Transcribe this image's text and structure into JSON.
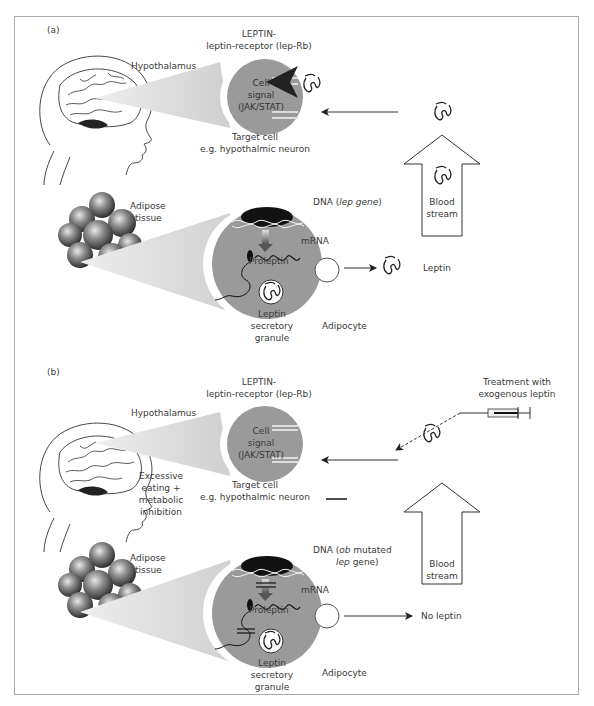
{
  "figure": {
    "panel_a": {
      "label": "(a)",
      "hypothalamus": "Hypothalamus",
      "receptor_line1": "LEPTIN-",
      "receptor_line2": "leptin-receptor (lep-Rb)",
      "cell_line1": "Cell",
      "cell_line2": "signal",
      "cell_line3": "(JAK/STAT)",
      "target_line1": "Target cell",
      "target_line2": "e.g. hypothalmic neuron",
      "adipose_line1": "Adipose",
      "adipose_line2": "tissue",
      "dna_prefix": "DNA (",
      "dna_gene": "lep gene",
      "dna_suffix": ")",
      "mrna": "mRNA",
      "proleptin": "Proleptin",
      "granule_line1": "Leptin",
      "granule_line2": "secretory",
      "granule_line3": "granule",
      "adipocyte": "Adipocyte",
      "leptin": "Leptin",
      "blood_line1": "Blood",
      "blood_line2": "stream"
    },
    "panel_b": {
      "label": "(b)",
      "hypothalamus": "Hypothalamus",
      "receptor_line1": "LEPTIN-",
      "receptor_line2": "leptin-receptor (lep-Rb)",
      "cell_line1": "Cell",
      "cell_line2": "signal",
      "cell_line3": "(JAK/STAT)",
      "target_line1": "Target cell",
      "target_line2": "e.g. hypothalmic neuron",
      "excess_line1": "Excessive",
      "excess_line2": "eating +",
      "excess_line3": "metabolic",
      "excess_line4": "inhibition",
      "treatment_line1": "Treatment with",
      "treatment_line2": "exogenous leptin",
      "adipose_line1": "Adipose",
      "adipose_line2": "tissue",
      "dna_prefix": "DNA (",
      "dna_ob": "ob",
      "dna_mid": " mutated",
      "dna_gene": "lep",
      "dna_suffix": " gene)",
      "mrna": "mRNA",
      "proleptin": "Proleptin",
      "granule_line1": "Leptin",
      "granule_line2": "secretory",
      "granule_line3": "granule",
      "adipocyte": "Adipocyte",
      "no_leptin": "No leptin",
      "blood_line1": "Blood",
      "blood_line2": "stream"
    },
    "colors": {
      "cell_fill": "#9a9a9a",
      "cone_fill": "#d9d9d9",
      "line": "#333333",
      "frame": "#a9a9a9"
    }
  }
}
